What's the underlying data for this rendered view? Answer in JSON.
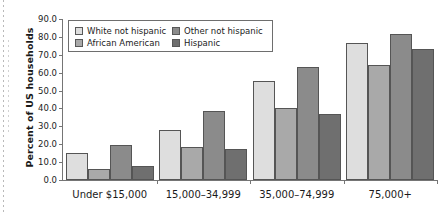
{
  "chart_data": {
    "type": "bar",
    "title": "",
    "xlabel": "",
    "ylabel": "Percent of US households",
    "ylim": [
      0.0,
      90.0
    ],
    "ytick_step": 10.0,
    "ytick_labels": [
      "0.0",
      "10.0",
      "20.0",
      "30.0",
      "40.0",
      "50.0",
      "60.0",
      "70.0",
      "80.0",
      "90.0"
    ],
    "ytick_values": [
      0,
      10,
      20,
      30,
      40,
      50,
      60,
      70,
      80,
      90
    ],
    "grid": false,
    "legend_position": "upper-left-inside",
    "categories": [
      "Under $15,000",
      "15,000–34,999",
      "35,000–74,999",
      "75,000+"
    ],
    "series": [
      {
        "name": "White not hispanic",
        "color": "#dedede",
        "values": [
          15.3,
          28.0,
          55.2,
          76.7
        ]
      },
      {
        "name": "African American",
        "color": "#a9a9a9",
        "values": [
          6.3,
          18.4,
          40.4,
          64.4
        ]
      },
      {
        "name": "Other not hispanic",
        "color": "#8b8b8b",
        "values": [
          19.8,
          38.5,
          62.9,
          81.5
        ]
      },
      {
        "name": "Hispanic",
        "color": "#6f6f6f",
        "values": [
          7.9,
          17.2,
          36.8,
          73.5
        ]
      }
    ]
  }
}
